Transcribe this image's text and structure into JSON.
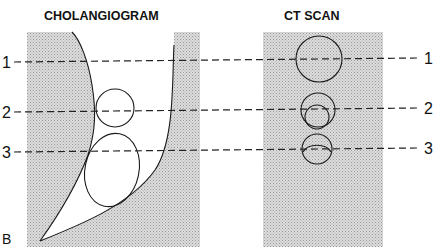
{
  "figure": {
    "panel_label": "B",
    "left_view": {
      "title": "CHOLANGIOGRAM"
    },
    "right_view": {
      "title": "CT SCAN"
    },
    "levels": [
      {
        "label": "1"
      },
      {
        "label": "2"
      },
      {
        "label": "3"
      }
    ],
    "colors": {
      "background_tissue": "#cfcfcf",
      "duct_lumen": "#ffffff",
      "line": "#1a1a1a"
    }
  }
}
